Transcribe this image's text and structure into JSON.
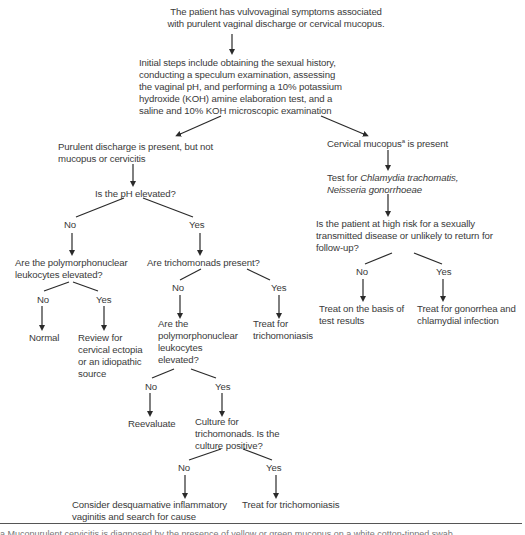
{
  "flowchart": {
    "start": "The patient has vulvovaginal symptoms associated\nwith purulent vaginal discharge or cervical mucopus.",
    "initial_steps": [
      "Initial steps include obtaining the sexual history,",
      "conducting a speculum examination, assessing",
      "the vaginal pH, and performing a 10% potassium",
      "hydroxide (KOH) amine elaboration test, and a",
      "saline and 10% KOH microscopic examination"
    ],
    "left_branch": {
      "condition": [
        "Purulent discharge is present, but not",
        "mucopus or cervicitis"
      ],
      "ph_question": "Is the pH elevated?",
      "no_label": "No",
      "yes_label": "Yes",
      "ph_no": {
        "question": [
          "Are the polymorphonuclear",
          "leukocytes elevated?"
        ],
        "no_label": "No",
        "yes_label": "Yes",
        "no_result": "Normal",
        "yes_result": [
          "Review for",
          "cervical ectopia",
          "or an idiopathic",
          "source"
        ]
      },
      "ph_yes": {
        "question": "Are trichomonads present?",
        "no_label": "No",
        "yes_label": "Yes",
        "yes_result": [
          "Treat for",
          "trichomoniasis"
        ],
        "trich_no": {
          "question": [
            "Are the",
            "polymorphonuclear",
            "leukocytes",
            "elevated?"
          ],
          "no_label": "No",
          "yes_label": "Yes",
          "no_result": "Reevaluate",
          "yes_result": [
            "Culture for",
            "trichomonads. Is the",
            "culture positive?"
          ],
          "culture": {
            "no_label": "No",
            "yes_label": "Yes",
            "no_result": [
              "Consider desquamative inflammatory",
              "vaginitis and search for cause"
            ],
            "yes_result": "Treat for trichomoniasis"
          }
        }
      }
    },
    "right_branch": {
      "condition_main": "Cervical mucopus",
      "condition_sup": "a",
      "condition_rest": " is present",
      "test_prefix": "Test for ",
      "test_org1": "Chlamydia trachomatis,",
      "test_org2": "Neisseria gonorrhoeae",
      "risk_question": [
        "Is the patient at high risk for a sexually",
        "transmitted disease or unlikely to return for",
        "follow-up?"
      ],
      "no_label": "No",
      "yes_label": "Yes",
      "no_result": [
        "Treat on the basis of",
        "test results"
      ],
      "yes_result": [
        "Treat for gonorrhea and",
        "chlamydial infection"
      ]
    }
  },
  "footnote_partial": "a  Mucopurulent cervicitis is diagnosed by the presence of yellow or green mucopus on a white cotton-tipped swab"
}
